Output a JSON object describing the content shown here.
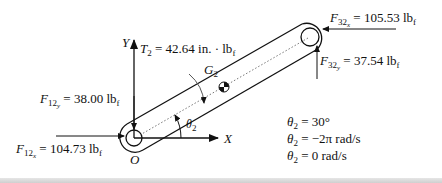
{
  "diagram": {
    "type": "free-body diagram of crank link",
    "axes": {
      "x_label": "X",
      "y_label": "Y",
      "origin_label": "O"
    },
    "link": {
      "cg_label_base": "G",
      "cg_label_sub": "2",
      "angle_label_base": "θ",
      "angle_label_sub": "2"
    },
    "forces": {
      "F12y": {
        "base": "F",
        "sub": "12",
        "subsub": "y",
        "value": "= 38.00 lb",
        "unit_sub": "f"
      },
      "F12x": {
        "base": "F",
        "sub": "12",
        "subsub": "x",
        "value": "= 104.73 lb",
        "unit_sub": "f"
      },
      "F32x": {
        "base": "F",
        "sub": "32",
        "subsub": "x",
        "value": "= 105.53 lb",
        "unit_sub": "f"
      },
      "F32y": {
        "base": "F",
        "sub": "32",
        "subsub": "y",
        "value": "= 37.54 lb",
        "unit_sub": "f"
      }
    },
    "torque": {
      "base": "T",
      "sub": "2",
      "value": "= 42.64 in. · lb",
      "unit_sub": "f"
    },
    "conditions": [
      {
        "symbol": "θ",
        "sub": "2",
        "dots": "",
        "value": "= 30°"
      },
      {
        "symbol": "θ",
        "sub": "2",
        "dots": "˙",
        "value": "= −2π rad/s"
      },
      {
        "symbol": "θ",
        "sub": "2",
        "dots": "¨",
        "value": "= 0 rad/s"
      }
    ]
  }
}
